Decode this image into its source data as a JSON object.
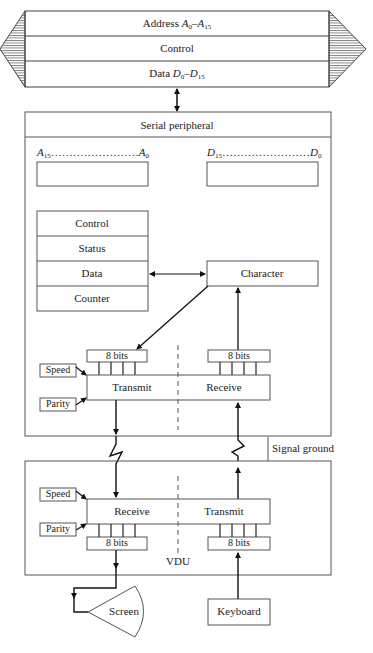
{
  "bus": {
    "rows": [
      {
        "prefix": "Address ",
        "from_sym": "A",
        "from_sub": "0",
        "sep": "–",
        "to_sym": "A",
        "to_sub": "15"
      },
      {
        "label": "Control"
      },
      {
        "prefix": "Data ",
        "from_sym": "D",
        "from_sub": "0",
        "sep": "–",
        "to_sym": "D",
        "to_sub": "15"
      }
    ]
  },
  "serial_peripheral": {
    "title": "Serial peripheral",
    "address_register": {
      "left_sym": "A",
      "left_sub": "15",
      "dots": "……………………",
      "right_sym": "A",
      "right_sub": "0"
    },
    "data_register": {
      "left_sym": "D",
      "left_sub": "15",
      "dots": "……………………",
      "right_sym": "D",
      "right_sub": "0"
    },
    "registers": [
      "Control",
      "Status",
      "Data",
      "Counter"
    ],
    "character": "Character",
    "tx_bits": "8 bits",
    "rx_bits": "8 bits",
    "transmit": "Transmit",
    "receive": "Receive",
    "speed": "Speed",
    "parity": "Parity"
  },
  "link": {
    "signal_ground": "Signal ground"
  },
  "vdu": {
    "title": "VDU",
    "receive": "Receive",
    "transmit": "Transmit",
    "rx_bits": "8 bits",
    "tx_bits": "8 bits",
    "speed": "Speed",
    "parity": "Parity",
    "screen": "Screen",
    "keyboard": "Keyboard"
  },
  "colors": {
    "line": "#222222",
    "background": "#ffffff"
  }
}
